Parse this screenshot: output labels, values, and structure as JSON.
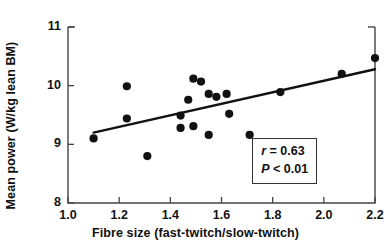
{
  "chart_data": {
    "type": "scatter",
    "title": "",
    "xlabel": "Fibre size (fast-twitch/slow-twitch)",
    "ylabel": "Mean power (W/kg lean BM)",
    "xlim": [
      1.0,
      2.2
    ],
    "ylim": [
      8,
      11
    ],
    "xticks": [
      "1.0",
      "1.2",
      "1.4",
      "1.6",
      "1.8",
      "2.0",
      "2.2"
    ],
    "xtick_values": [
      1.0,
      1.2,
      1.4,
      1.6,
      1.8,
      2.0,
      2.2
    ],
    "yticks": [
      "8",
      "9",
      "10",
      "11"
    ],
    "ytick_values": [
      8,
      9,
      10,
      11
    ],
    "grid": false,
    "legend": "none",
    "marker": "filled-circle",
    "marker_color": "#111111",
    "points": [
      {
        "x": 1.1,
        "y": 9.1
      },
      {
        "x": 1.23,
        "y": 9.99
      },
      {
        "x": 1.23,
        "y": 9.44
      },
      {
        "x": 1.31,
        "y": 8.8
      },
      {
        "x": 1.44,
        "y": 9.49
      },
      {
        "x": 1.44,
        "y": 9.28
      },
      {
        "x": 1.47,
        "y": 9.76
      },
      {
        "x": 1.49,
        "y": 10.12
      },
      {
        "x": 1.49,
        "y": 9.31
      },
      {
        "x": 1.52,
        "y": 10.07
      },
      {
        "x": 1.55,
        "y": 9.86
      },
      {
        "x": 1.55,
        "y": 9.16
      },
      {
        "x": 1.58,
        "y": 9.81
      },
      {
        "x": 1.62,
        "y": 9.86
      },
      {
        "x": 1.63,
        "y": 9.52
      },
      {
        "x": 1.71,
        "y": 9.16
      },
      {
        "x": 1.83,
        "y": 9.89
      },
      {
        "x": 2.07,
        "y": 10.2
      },
      {
        "x": 2.2,
        "y": 10.47
      }
    ],
    "trendline": {
      "type": "linear-fit",
      "x_start": 1.1,
      "y_start": 9.2,
      "x_end": 2.2,
      "y_end": 10.28
    },
    "annotations": {
      "r_label": "r",
      "r_relation": " = ",
      "r_value": "0.63",
      "p_label": "P",
      "p_relation": " < ",
      "p_value": "0.01",
      "r_text": "r = 0.63",
      "p_text": "P < 0.01"
    }
  },
  "axes": {
    "frame_color": "#444444",
    "line_color": "#111111"
  }
}
